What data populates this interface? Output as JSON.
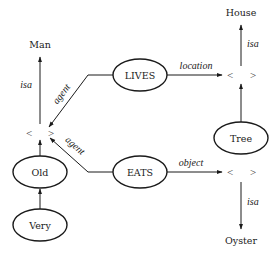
{
  "diagram": {
    "type": "semantic-network",
    "nodes": {
      "man": {
        "label": "Man"
      },
      "house": {
        "label": "House"
      },
      "oyster": {
        "label": "Oyster"
      },
      "lives": {
        "label": "LIVES"
      },
      "eats": {
        "label": "EATS"
      },
      "tree": {
        "label": "Tree"
      },
      "old": {
        "label": "Old"
      },
      "very": {
        "label": "Very"
      },
      "person_instance": {
        "left": "<",
        "right": ">"
      },
      "location_instance": {
        "left": "<",
        "right": ">"
      },
      "object_instance": {
        "left": "<",
        "right": ">"
      }
    },
    "edges": {
      "person_isa_man": {
        "label": "isa"
      },
      "lives_agent": {
        "label": "agent"
      },
      "eats_agent": {
        "label": "agent"
      },
      "lives_location": {
        "label": "location"
      },
      "eats_object": {
        "label": "object"
      },
      "location_isa_house": {
        "label": "isa"
      },
      "object_isa_oyster": {
        "label": "isa"
      }
    },
    "colors": {
      "stroke": "#1a1a1a",
      "background": "#ffffff"
    }
  }
}
